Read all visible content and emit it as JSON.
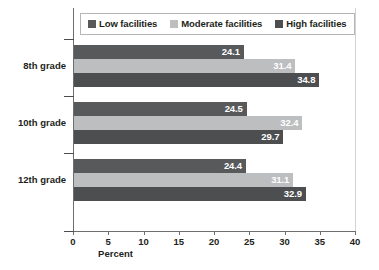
{
  "chart_data": {
    "type": "bar",
    "orientation": "horizontal",
    "title": "",
    "xlabel": "Percent",
    "ylabel": "",
    "xlim": [
      0,
      40
    ],
    "xticks": [
      0,
      5,
      10,
      15,
      20,
      25,
      30,
      35,
      40
    ],
    "grid": false,
    "legend_position": "top",
    "categories": [
      "8th grade",
      "10th grade",
      "12th grade"
    ],
    "series": [
      {
        "name": "Low facilities",
        "color": "#58595b",
        "values": [
          24.1,
          24.5,
          24.4
        ],
        "labels": [
          "24.1",
          "24.5",
          "24.4"
        ]
      },
      {
        "name": "Moderate facilities",
        "color": "#bcbec0",
        "values": [
          31.4,
          32.4,
          31.1
        ],
        "labels": [
          "31.4",
          "32.4",
          "31.1"
        ]
      },
      {
        "name": "High facilities",
        "color": "#4d4e50",
        "values": [
          34.8,
          29.7,
          32.9
        ],
        "labels": [
          "34.8",
          "29.7",
          "32.9"
        ]
      }
    ]
  },
  "legend": {
    "items": [
      {
        "label": "Low facilities",
        "color": "#58595b"
      },
      {
        "label": "Moderate facilities",
        "color": "#bcbec0"
      },
      {
        "label": "High facilities",
        "color": "#4d4e50"
      }
    ]
  },
  "axis": {
    "x_title": "Percent",
    "x_tick_labels": [
      "0",
      "5",
      "10",
      "15",
      "20",
      "25",
      "30",
      "35",
      "40"
    ],
    "y_tick_labels": [
      "8th grade",
      "10th grade",
      "12th grade"
    ]
  },
  "colors": {
    "axis": "#6d6e70",
    "text": "#231f20",
    "value_label": "#ffffff",
    "legend_border": "#b5b5b5",
    "plot_right_edge": "#d4d4d4"
  }
}
